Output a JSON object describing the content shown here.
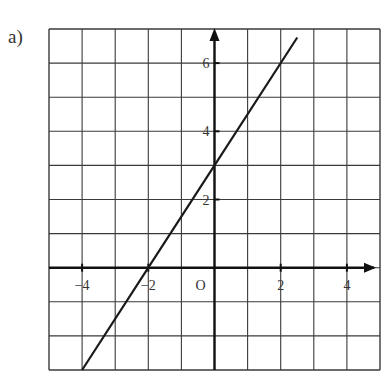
{
  "figure": {
    "part_label": "a)",
    "origin_label": "O"
  },
  "chart_data": {
    "type": "line",
    "title": "",
    "xlabel": "",
    "ylabel": "",
    "xlim": [
      -5,
      5
    ],
    "ylim": [
      -3,
      7
    ],
    "grid": true,
    "x_ticks": [
      {
        "value": -4,
        "label": "−4"
      },
      {
        "value": -2,
        "label": "−2"
      },
      {
        "value": 2,
        "label": "2"
      },
      {
        "value": 4,
        "label": "4"
      }
    ],
    "y_ticks": [
      {
        "value": 2,
        "label": "2"
      },
      {
        "value": 4,
        "label": "4"
      },
      {
        "value": 6,
        "label": "6"
      }
    ],
    "series": [
      {
        "name": "y = 1.5x + 3",
        "x": [
          -4,
          -2,
          0,
          2.5
        ],
        "y": [
          -3,
          0,
          3,
          6.75
        ],
        "color": "#1a1a1a"
      }
    ],
    "axis_color": "#111111",
    "grid_color": "#3a3a3a"
  }
}
